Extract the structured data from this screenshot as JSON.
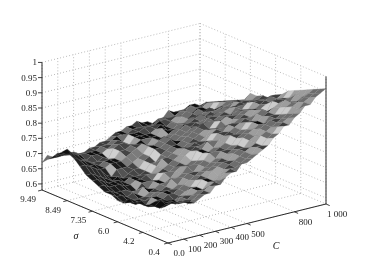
{
  "chart_data": {
    "type": "surface",
    "title": "",
    "xlabel": "C",
    "ylabel": "σ",
    "zlabel": "",
    "x_values": [
      0,
      100,
      200,
      300,
      400,
      500,
      600,
      700,
      800,
      900,
      1000
    ],
    "y_values": [
      9.49,
      8.49,
      7.35,
      6.0,
      4.2,
      0.4
    ],
    "z_matrix": [
      [
        0.68,
        0.69,
        0.67,
        0.68,
        0.7,
        0.71,
        0.72,
        0.72,
        0.73,
        0.74,
        0.74
      ],
      [
        0.74,
        0.71,
        0.67,
        0.68,
        0.71,
        0.72,
        0.73,
        0.74,
        0.75,
        0.76,
        0.78
      ],
      [
        0.68,
        0.66,
        0.645,
        0.665,
        0.7,
        0.73,
        0.75,
        0.77,
        0.79,
        0.81,
        0.83
      ],
      [
        0.65,
        0.635,
        0.655,
        0.675,
        0.705,
        0.74,
        0.77,
        0.8,
        0.83,
        0.85,
        0.87
      ],
      [
        0.67,
        0.655,
        0.665,
        0.695,
        0.73,
        0.76,
        0.79,
        0.83,
        0.86,
        0.89,
        0.92
      ],
      [
        0.72,
        0.695,
        0.7,
        0.72,
        0.75,
        0.78,
        0.81,
        0.85,
        0.89,
        0.93,
        0.96
      ]
    ],
    "zlim": [
      0.6,
      1.0
    ],
    "x_ticks": {
      "labels": [
        "0.0",
        "100",
        "200",
        "300",
        "400",
        "500",
        "800",
        "1 000"
      ],
      "values": [
        0,
        100,
        200,
        300,
        400,
        500,
        800,
        1000
      ]
    },
    "y_ticks": {
      "labels": [
        "9.49",
        "8.49",
        "7.35",
        "6.0",
        "4.2",
        "0.4"
      ],
      "even_spacing": true
    },
    "z_ticks": {
      "labels": [
        "1",
        "0.95",
        "0.9",
        "0.85",
        "0.8",
        "0.75",
        "0.7",
        "0.65",
        "0.6"
      ],
      "values": [
        1,
        0.95,
        0.9,
        0.85,
        0.8,
        0.75,
        0.7,
        0.65,
        0.6
      ]
    },
    "grid": true,
    "legend": "none",
    "style": "dark mesh surface with dotted box grid"
  },
  "colors": {
    "background": "#ffffff",
    "grid": "#ababab",
    "axis": "#2b2b2b",
    "tick_text": "#1a1a1a",
    "surface_dark": "#0d0d0d",
    "surface_light": "#c8c8c8",
    "mesh_line": "#7d7d7d"
  }
}
